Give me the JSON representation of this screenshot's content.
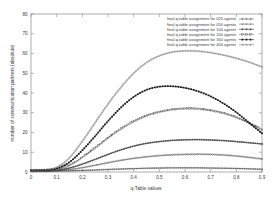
{
  "chart_data": {
    "type": "line",
    "title": "",
    "xlabel": "q-Table values",
    "ylabel": "number of communication partners (absolute)",
    "xlim": [
      0,
      0.9
    ],
    "ylim": [
      0,
      80
    ],
    "xticks": [
      "0",
      "0.1",
      "0.2",
      "0.3",
      "0.4",
      "0.5",
      "0.6",
      "0.7",
      "0.8",
      "0.9"
    ],
    "xtick_values": [
      0,
      0.1,
      0.2,
      0.3,
      0.4,
      0.5,
      0.6,
      0.7,
      0.8,
      0.9
    ],
    "yticks": [
      "0",
      "10",
      "20",
      "30",
      "40",
      "50",
      "60",
      "70",
      "80"
    ],
    "ytick_values": [
      0,
      10,
      20,
      30,
      40,
      50,
      60,
      70,
      80
    ],
    "grid": false,
    "legend_position": "top-right",
    "x": [
      0,
      0.05,
      0.1,
      0.15,
      0.2,
      0.25,
      0.3,
      0.35,
      0.4,
      0.45,
      0.5,
      0.55,
      0.6,
      0.65,
      0.7,
      0.75,
      0.8,
      0.85,
      0.9
    ],
    "series": [
      {
        "name": "final q-table assignment for 025 agents",
        "agents": 25,
        "color": "#4a4a4a",
        "marker": "plus",
        "values": [
          0.4,
          0.4,
          0.5,
          0.6,
          0.8,
          1.0,
          1.3,
          1.5,
          1.7,
          1.9,
          2.0,
          2.1,
          2.1,
          2.1,
          2.0,
          1.9,
          1.8,
          1.6,
          1.4
        ]
      },
      {
        "name": "final q-table assignment for 050 agents",
        "agents": 50,
        "color": "#5a5a5a",
        "marker": "cross",
        "values": [
          0.5,
          0.5,
          0.7,
          1.2,
          2.2,
          3.4,
          4.7,
          5.9,
          6.9,
          7.7,
          8.3,
          8.7,
          8.9,
          9.0,
          8.9,
          8.6,
          8.1,
          7.4,
          6.6
        ]
      },
      {
        "name": "final q-table assignment for 100 agents",
        "agents": 100,
        "color": "#2a2a2a",
        "marker": "star",
        "values": [
          0.6,
          0.6,
          0.9,
          2.0,
          4.0,
          6.4,
          8.9,
          11.2,
          13.1,
          14.5,
          15.4,
          16.0,
          16.3,
          16.4,
          16.2,
          15.9,
          15.4,
          14.8,
          14.2
        ]
      },
      {
        "name": "final q-table assignment for 200 agents",
        "agents": 200,
        "color": "#6a6a6a",
        "marker": "square-open",
        "values": [
          0.7,
          0.8,
          1.3,
          3.4,
          7.4,
          12.2,
          17.2,
          21.8,
          25.6,
          28.5,
          30.4,
          31.6,
          32.1,
          32.0,
          31.2,
          29.8,
          27.7,
          24.8,
          21.4
        ]
      },
      {
        "name": "final q-table assignment for 300 agents",
        "agents": 300,
        "color": "#101010",
        "marker": "square-filled",
        "values": [
          0.9,
          1.0,
          1.8,
          5.0,
          11.0,
          18.2,
          25.8,
          32.6,
          38.0,
          41.6,
          43.2,
          43.4,
          42.6,
          40.9,
          38.3,
          34.7,
          30.2,
          24.9,
          19.6
        ]
      },
      {
        "name": "final q-table assignment for 400 agents",
        "agents": 400,
        "color": "#737373",
        "marker": "circle-open",
        "values": [
          1.0,
          1.2,
          2.4,
          7.2,
          15.6,
          25.0,
          34.4,
          42.8,
          50.0,
          55.4,
          58.8,
          60.7,
          61.3,
          61.2,
          60.4,
          59.2,
          57.6,
          55.6,
          53.2
        ]
      }
    ]
  },
  "axes": {
    "xlabel": "q-Table values",
    "ylabel": "number of communication partners (absolute)"
  }
}
